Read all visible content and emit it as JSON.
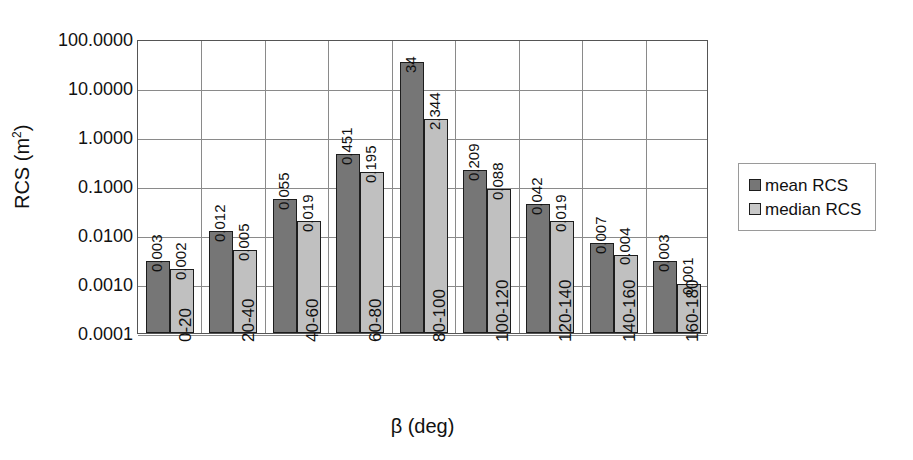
{
  "chart_data": {
    "type": "bar",
    "title": "",
    "xlabel": "β (deg)",
    "ylabel": "RCS (m²)",
    "yscale": "log",
    "ylim": [
      0.0001,
      100
    ],
    "grid": true,
    "legend_position": "right",
    "categories": [
      "0-20",
      "20-40",
      "40-60",
      "60-80",
      "80-100",
      "100-120",
      "120-140",
      "140-160",
      "160-180"
    ],
    "ytick_labels": [
      "100.0000",
      "10.0000",
      "1.0000",
      "0.1000",
      "0.0100",
      "0.0010",
      "0.0001"
    ],
    "ytick_values": [
      100,
      10,
      1,
      0.1,
      0.01,
      0.001,
      0.0001
    ],
    "series": [
      {
        "name": "mean RCS",
        "color": "#767676",
        "values": [
          0.003,
          0.012,
          0.055,
          0.451,
          34,
          0.209,
          0.042,
          0.007,
          0.003
        ],
        "labels": [
          "0.003",
          "0.012",
          "0.055",
          "0.451",
          "34",
          "0.209",
          "0.042",
          "0.007",
          "0.003"
        ]
      },
      {
        "name": "median RCS",
        "color": "#c0c0c0",
        "values": [
          0.002,
          0.005,
          0.019,
          0.195,
          2.344,
          0.088,
          0.019,
          0.004,
          0.001
        ],
        "labels": [
          "0.002",
          "0.005",
          "0.019",
          "0.195",
          "2.344",
          "0.088",
          "0.019",
          "0.004",
          "0.001"
        ]
      }
    ]
  },
  "axis": {
    "y_title_main": "RCS (m",
    "y_title_sup": "2",
    "y_title_tail": ")",
    "x_title": "β (deg)"
  },
  "legend": {
    "items": [
      {
        "label": "mean RCS",
        "swatch": "mean"
      },
      {
        "label": "median RCS",
        "swatch": "median"
      }
    ]
  }
}
